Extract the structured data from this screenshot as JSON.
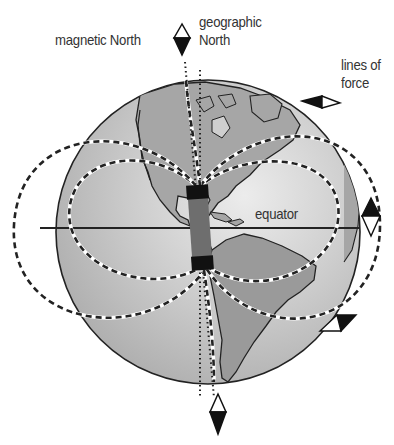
{
  "diagram": {
    "type": "earth-magnetic-field",
    "labels": {
      "magnetic_north": "magnetic North",
      "geographic_north_line1": "geographic",
      "geographic_north_line2": "North",
      "lines_of_force_line1": "lines of",
      "lines_of_force_line2": "force",
      "equator": "equator"
    },
    "elements": {
      "globe": "earth-globe-americas",
      "bar_magnet": "bar-magnet",
      "compasses": [
        "compass-top-magnetic-north",
        "compass-right-upper",
        "compass-right-equator",
        "compass-right-lower",
        "compass-bottom"
      ],
      "field_lines": "dashed-lines-of-force",
      "axes": [
        "magnetic-axis",
        "geographic-axis"
      ]
    },
    "colors": {
      "globe_fill": "#bdbdbd",
      "globe_highlight": "#e4e4e4",
      "land": "#9a9a9a",
      "outline": "#222222",
      "magnet_body": "#6e6e6e",
      "magnet_poles": "#111111",
      "text": "#333333"
    }
  }
}
